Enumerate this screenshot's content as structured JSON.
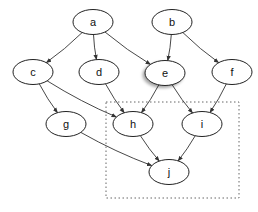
{
  "diagram": {
    "type": "directed-graph",
    "nodes": [
      {
        "id": "a",
        "label": "a",
        "cx": 93,
        "cy": 22,
        "highlighted": false
      },
      {
        "id": "b",
        "label": "b",
        "cx": 172,
        "cy": 22,
        "highlighted": false
      },
      {
        "id": "c",
        "label": "c",
        "cx": 33,
        "cy": 72,
        "highlighted": false
      },
      {
        "id": "d",
        "label": "d",
        "cx": 99,
        "cy": 72,
        "highlighted": false
      },
      {
        "id": "e",
        "label": "e",
        "cx": 165,
        "cy": 73,
        "highlighted": true
      },
      {
        "id": "f",
        "label": "f",
        "cx": 232,
        "cy": 72,
        "highlighted": false
      },
      {
        "id": "g",
        "label": "g",
        "cx": 66,
        "cy": 124,
        "highlighted": false
      },
      {
        "id": "h",
        "label": "h",
        "cx": 133,
        "cy": 124,
        "highlighted": false
      },
      {
        "id": "i",
        "label": "i",
        "cx": 202,
        "cy": 124,
        "highlighted": false
      },
      {
        "id": "j",
        "label": "j",
        "cx": 169,
        "cy": 172,
        "highlighted": false
      }
    ],
    "edges": [
      {
        "from": "a",
        "to": "c"
      },
      {
        "from": "a",
        "to": "d"
      },
      {
        "from": "a",
        "to": "e"
      },
      {
        "from": "b",
        "to": "e"
      },
      {
        "from": "b",
        "to": "f"
      },
      {
        "from": "c",
        "to": "g"
      },
      {
        "from": "c",
        "to": "h"
      },
      {
        "from": "d",
        "to": "h"
      },
      {
        "from": "e",
        "to": "h"
      },
      {
        "from": "e",
        "to": "i"
      },
      {
        "from": "f",
        "to": "i"
      },
      {
        "from": "g",
        "to": "j"
      },
      {
        "from": "h",
        "to": "j"
      },
      {
        "from": "i",
        "to": "j"
      }
    ],
    "cluster": {
      "label": "",
      "x": 106,
      "y": 102,
      "width": 133,
      "height": 96,
      "style": "dotted"
    },
    "colors": {
      "stroke": "#222222",
      "background": "#ffffff",
      "cluster": "#666666"
    }
  }
}
